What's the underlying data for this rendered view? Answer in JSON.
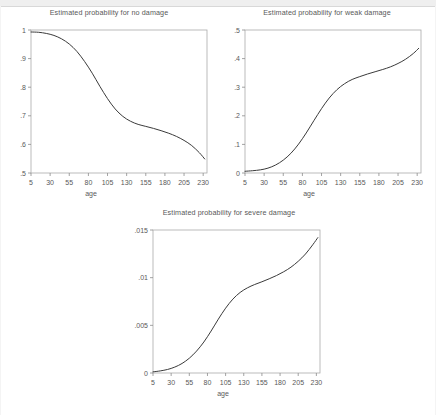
{
  "canvas": {
    "width": 436,
    "height": 415,
    "background": "#ffffff",
    "band_color": "#efefef"
  },
  "style": {
    "line_color": "#3a3a3a",
    "axis_color": "#8c8c8c",
    "frame_color": "#aaaaaa",
    "text_color": "#595959"
  },
  "charts": [
    {
      "id": "no-damage",
      "title": "Estimated probability for no damage",
      "xlabel": "age"
    },
    {
      "id": "weak-damage",
      "title": "Estimated probability for weak damage",
      "xlabel": "age"
    },
    {
      "id": "severe-damage",
      "title": "Estimated probability for severe damage",
      "xlabel": "age"
    }
  ],
  "chart_data": [
    {
      "type": "line",
      "title": "Estimated probability for no damage",
      "xlabel": "age",
      "ylabel": "",
      "xlim": [
        5,
        235
      ],
      "ylim": [
        0.5,
        1.0
      ],
      "grid": false,
      "legend": "none",
      "xticks": [
        5,
        30,
        55,
        80,
        105,
        130,
        155,
        180,
        205,
        230
      ],
      "xticklabels": [
        "5",
        "30",
        "55",
        "80",
        "105",
        "130",
        "155",
        "180",
        "205",
        "230"
      ],
      "yticks": [
        0.5,
        0.6,
        0.7,
        0.8,
        0.9,
        1.0
      ],
      "yticklabels": [
        ".5",
        ".6",
        ".7",
        ".8",
        ".9",
        "1"
      ],
      "x": [
        5,
        15,
        25,
        35,
        45,
        55,
        65,
        75,
        85,
        95,
        105,
        115,
        125,
        135,
        145,
        155,
        165,
        175,
        185,
        195,
        205,
        215,
        225,
        232
      ],
      "y": [
        0.993,
        0.992,
        0.988,
        0.981,
        0.969,
        0.951,
        0.925,
        0.89,
        0.849,
        0.803,
        0.76,
        0.724,
        0.698,
        0.681,
        0.67,
        0.663,
        0.656,
        0.648,
        0.639,
        0.628,
        0.614,
        0.596,
        0.571,
        0.549
      ]
    },
    {
      "type": "line",
      "title": "Estimated probability for weak damage",
      "xlabel": "age",
      "ylabel": "",
      "xlim": [
        5,
        235
      ],
      "ylim": [
        0.0,
        0.5
      ],
      "grid": false,
      "legend": "none",
      "xticks": [
        5,
        30,
        55,
        80,
        105,
        130,
        155,
        180,
        205,
        230
      ],
      "xticklabels": [
        "5",
        "30",
        "55",
        "80",
        "105",
        "130",
        "155",
        "180",
        "205",
        "230"
      ],
      "yticks": [
        0.0,
        0.1,
        0.2,
        0.3,
        0.4,
        0.5
      ],
      "yticklabels": [
        "0",
        ".1",
        ".2",
        ".3",
        ".4",
        ".5"
      ],
      "x": [
        5,
        15,
        25,
        35,
        45,
        55,
        65,
        75,
        85,
        95,
        105,
        115,
        125,
        135,
        145,
        155,
        165,
        175,
        185,
        195,
        205,
        215,
        225,
        232
      ],
      "y": [
        0.006,
        0.008,
        0.011,
        0.017,
        0.028,
        0.045,
        0.069,
        0.101,
        0.14,
        0.183,
        0.225,
        0.262,
        0.291,
        0.312,
        0.327,
        0.337,
        0.346,
        0.354,
        0.362,
        0.371,
        0.383,
        0.398,
        0.418,
        0.436
      ]
    },
    {
      "type": "line",
      "title": "Estimated probability for severe damage",
      "xlabel": "age",
      "ylabel": "",
      "xlim": [
        5,
        235
      ],
      "ylim": [
        0.0,
        0.015
      ],
      "grid": false,
      "legend": "none",
      "xticks": [
        5,
        30,
        55,
        80,
        105,
        130,
        155,
        180,
        205,
        230
      ],
      "xticklabels": [
        "5",
        "30",
        "55",
        "80",
        "105",
        "130",
        "155",
        "180",
        "205",
        "230"
      ],
      "yticks": [
        0.0,
        0.005,
        0.01,
        0.015
      ],
      "yticklabels": [
        "0",
        ".005",
        ".01",
        ".015"
      ],
      "x": [
        5,
        15,
        25,
        35,
        45,
        55,
        65,
        75,
        85,
        95,
        105,
        115,
        125,
        135,
        145,
        155,
        165,
        175,
        185,
        195,
        205,
        215,
        225,
        232
      ],
      "y": [
        0.00012,
        0.00022,
        0.00037,
        0.00062,
        0.001,
        0.00155,
        0.0023,
        0.00325,
        0.0044,
        0.00565,
        0.0068,
        0.00775,
        0.00845,
        0.00893,
        0.00928,
        0.00957,
        0.00988,
        0.01022,
        0.01062,
        0.0111,
        0.01172,
        0.01248,
        0.01345,
        0.0142
      ]
    }
  ]
}
